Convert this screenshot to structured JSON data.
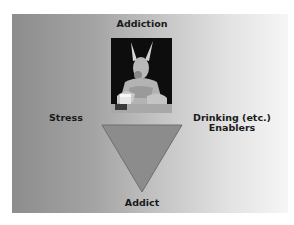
{
  "slide": {
    "title": "Addiction",
    "left_label": "Stress",
    "right_label_line1": "Drinking (etc.)",
    "right_label_line2": "Enablers",
    "bottom_label": "Addict",
    "image_subject": "kangaroo-with-beer-photo",
    "colors": {
      "background_left": "#8d8d8d",
      "background_right": "#f6f6f6",
      "triangle_fill": "#8c8c8c",
      "triangle_stroke": "#6e6e6e",
      "text": "#1a1a1a"
    }
  }
}
